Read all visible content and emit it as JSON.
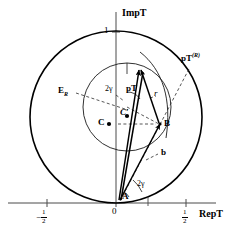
{
  "figure": {
    "type": "complex-plane-geometry-diagram",
    "axes": {
      "vertical_label": "ImpT",
      "horizontal_label": "RepT",
      "vertical_tick_label": "1",
      "origin_label": "0",
      "left_tick_numerator": "1",
      "left_tick_denominator": "2",
      "right_tick_numerator": "1",
      "right_tick_denominator": "2",
      "minus_sign": "−"
    },
    "labels": {
      "unitarity_circle": "E",
      "unitarity_circle_sub": "R",
      "center_big": "C",
      "center_small": "C′",
      "point_b": "B",
      "point_a": "A",
      "vector_pt": "pT",
      "vector_pt_r": "pT",
      "vector_pt_r_sup": "(R)",
      "radius_r": "r",
      "chord_b": "b",
      "angle_top": "2γ",
      "angle_bottom": "2γ"
    },
    "colors": {
      "stroke": "#000000",
      "axis": "#555555",
      "thin": "#333333",
      "background": "#ffffff"
    }
  }
}
